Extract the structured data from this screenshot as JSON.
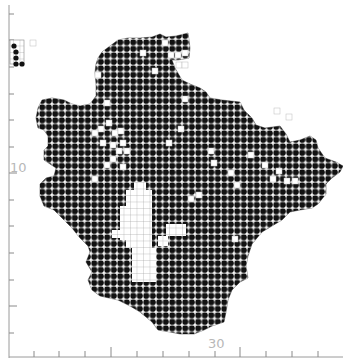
{
  "figure": {
    "type": "gridded-distribution-map",
    "background": "#ffffff",
    "fill_color": "#111111",
    "grid_color": "#cccccc",
    "cell_size_px": 6.5
  },
  "axes": {
    "y_tick_label": "10",
    "x_tick_label": "30",
    "y_ticks_px": [
      14,
      40,
      67,
      94,
      120,
      147,
      173,
      200,
      226,
      253,
      280,
      306,
      333
    ],
    "y_major_ticks_px": [
      173,
      306
    ],
    "x_ticks_px": [
      34,
      59,
      85,
      111,
      137,
      163,
      189,
      215,
      240,
      266,
      292,
      318
    ],
    "x_major_ticks_px": [
      111,
      240
    ]
  },
  "inset": {
    "label": "small-outlier-cells"
  },
  "map": {
    "outline": [
      [
        118,
        40
      ],
      [
        128,
        38
      ],
      [
        140,
        38
      ],
      [
        152,
        37
      ],
      [
        160,
        34
      ],
      [
        166,
        37
      ],
      [
        176,
        36
      ],
      [
        188,
        33
      ],
      [
        190,
        48
      ],
      [
        189,
        58
      ],
      [
        178,
        60
      ],
      [
        172,
        60
      ],
      [
        175,
        68
      ],
      [
        182,
        80
      ],
      [
        190,
        84
      ],
      [
        200,
        88
      ],
      [
        206,
        92
      ],
      [
        210,
        98
      ],
      [
        222,
        100
      ],
      [
        240,
        102
      ],
      [
        244,
        110
      ],
      [
        252,
        118
      ],
      [
        256,
        125
      ],
      [
        265,
        128
      ],
      [
        280,
        126
      ],
      [
        286,
        134
      ],
      [
        290,
        142
      ],
      [
        300,
        140
      ],
      [
        310,
        136
      ],
      [
        316,
        140
      ],
      [
        318,
        148
      ],
      [
        325,
        158
      ],
      [
        336,
        162
      ],
      [
        343,
        166
      ],
      [
        340,
        172
      ],
      [
        332,
        178
      ],
      [
        326,
        184
      ],
      [
        326,
        194
      ],
      [
        318,
        204
      ],
      [
        312,
        208
      ],
      [
        300,
        210
      ],
      [
        290,
        212
      ],
      [
        282,
        220
      ],
      [
        272,
        226
      ],
      [
        262,
        232
      ],
      [
        252,
        244
      ],
      [
        248,
        256
      ],
      [
        246,
        266
      ],
      [
        248,
        278
      ],
      [
        240,
        282
      ],
      [
        232,
        290
      ],
      [
        228,
        300
      ],
      [
        226,
        312
      ],
      [
        224,
        322
      ],
      [
        212,
        326
      ],
      [
        204,
        330
      ],
      [
        194,
        334
      ],
      [
        180,
        334
      ],
      [
        170,
        332
      ],
      [
        158,
        330
      ],
      [
        152,
        322
      ],
      [
        140,
        312
      ],
      [
        130,
        306
      ],
      [
        118,
        300
      ],
      [
        100,
        296
      ],
      [
        92,
        290
      ],
      [
        88,
        280
      ],
      [
        92,
        272
      ],
      [
        86,
        262
      ],
      [
        90,
        252
      ],
      [
        88,
        246
      ],
      [
        80,
        238
      ],
      [
        72,
        228
      ],
      [
        66,
        222
      ],
      [
        60,
        216
      ],
      [
        54,
        210
      ],
      [
        44,
        206
      ],
      [
        40,
        196
      ],
      [
        40,
        184
      ],
      [
        46,
        178
      ],
      [
        54,
        176
      ],
      [
        56,
        168
      ],
      [
        50,
        164
      ],
      [
        44,
        160
      ],
      [
        44,
        150
      ],
      [
        48,
        146
      ],
      [
        48,
        136
      ],
      [
        44,
        130
      ],
      [
        38,
        128
      ],
      [
        36,
        118
      ],
      [
        38,
        108
      ],
      [
        42,
        100
      ],
      [
        52,
        98
      ],
      [
        64,
        100
      ],
      [
        72,
        104
      ],
      [
        80,
        106
      ],
      [
        90,
        104
      ],
      [
        96,
        96
      ],
      [
        96,
        84
      ],
      [
        95,
        72
      ],
      [
        96,
        64
      ],
      [
        98,
        58
      ],
      [
        102,
        52
      ],
      [
        110,
        46
      ]
    ],
    "holes": [
      [
        162,
        40
      ],
      [
        140,
        50
      ],
      [
        168,
        52
      ],
      [
        175,
        52
      ],
      [
        182,
        50
      ],
      [
        176,
        62
      ],
      [
        182,
        62
      ],
      [
        104,
        100
      ],
      [
        182,
        96
      ],
      [
        152,
        68
      ],
      [
        95,
        72
      ],
      [
        98,
        126
      ],
      [
        92,
        130
      ],
      [
        106,
        120
      ],
      [
        100,
        140
      ],
      [
        112,
        130
      ],
      [
        118,
        128
      ],
      [
        110,
        142
      ],
      [
        116,
        148
      ],
      [
        120,
        140
      ],
      [
        124,
        148
      ],
      [
        110,
        156
      ],
      [
        104,
        162
      ],
      [
        120,
        164
      ],
      [
        92,
        176
      ],
      [
        178,
        126
      ],
      [
        166,
        140
      ],
      [
        208,
        148
      ],
      [
        211,
        160
      ],
      [
        248,
        152
      ],
      [
        262,
        162
      ],
      [
        270,
        176
      ],
      [
        276,
        168
      ],
      [
        284,
        178
      ],
      [
        292,
        178
      ],
      [
        228,
        170
      ],
      [
        234,
        182
      ],
      [
        196,
        192
      ],
      [
        274,
        108
      ],
      [
        286,
        114
      ],
      [
        232,
        236
      ],
      [
        188,
        196
      ],
      [
        30,
        40
      ]
    ],
    "clearings": [
      {
        "x": 126,
        "y": 190,
        "w": 26,
        "h": 58
      },
      {
        "x": 134,
        "y": 182,
        "w": 12,
        "h": 10
      },
      {
        "x": 120,
        "y": 206,
        "w": 8,
        "h": 34
      },
      {
        "x": 132,
        "y": 248,
        "w": 24,
        "h": 34
      },
      {
        "x": 166,
        "y": 224,
        "w": 20,
        "h": 12
      },
      {
        "x": 158,
        "y": 236,
        "w": 10,
        "h": 10
      },
      {
        "x": 112,
        "y": 230,
        "w": 10,
        "h": 8
      }
    ],
    "inset_cells": [
      [
        12,
        44
      ],
      [
        14,
        50
      ],
      [
        14,
        56
      ],
      [
        14,
        62
      ],
      [
        20,
        62
      ]
    ]
  }
}
